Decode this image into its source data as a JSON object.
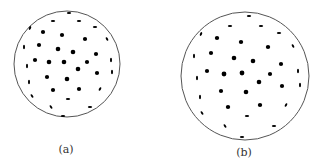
{
  "figure": {
    "colors": {
      "outline": "#555555",
      "dot": "#000000",
      "background": "#ffffff"
    },
    "panels": [
      {
        "id": "a",
        "label": "(a)",
        "label_pos": [
          66,
          150
        ],
        "circle": {
          "cx": 67,
          "cy": 64,
          "r": 53
        },
        "dots": [
          [
            69,
            13,
            2.2,
            1.0,
            0
          ],
          [
            53,
            21,
            2.2,
            1.0,
            0
          ],
          [
            79,
            21,
            2.2,
            1.0,
            0
          ],
          [
            30,
            28,
            1.0,
            2.0,
            25
          ],
          [
            95,
            27,
            2.2,
            1.0,
            0
          ],
          [
            43,
            32,
            2.1,
            2.1,
            0
          ],
          [
            62,
            35,
            2.1,
            2.1,
            0
          ],
          [
            85,
            39,
            2.1,
            2.0,
            0
          ],
          [
            107,
            39,
            1.0,
            2.0,
            -30
          ],
          [
            24,
            47,
            1.0,
            2.2,
            0
          ],
          [
            39,
            45,
            2.1,
            2.1,
            0
          ],
          [
            58,
            49,
            2.3,
            2.3,
            0
          ],
          [
            73,
            52,
            2.3,
            2.3,
            0
          ],
          [
            96,
            54,
            2.1,
            2.1,
            0
          ],
          [
            35,
            60,
            2.1,
            2.1,
            0
          ],
          [
            49,
            62,
            2.3,
            2.3,
            0
          ],
          [
            64,
            62,
            2.3,
            2.3,
            0
          ],
          [
            87,
            62,
            2.1,
            2.1,
            0
          ],
          [
            111,
            60,
            1.0,
            2.2,
            0
          ],
          [
            27,
            66,
            1.0,
            2.2,
            0
          ],
          [
            78,
            69,
            2.3,
            2.3,
            0
          ],
          [
            97,
            73,
            2.1,
            2.1,
            0
          ],
          [
            112,
            72,
            1.0,
            2.2,
            0
          ],
          [
            47,
            77,
            2.1,
            2.1,
            0
          ],
          [
            67,
            79,
            2.3,
            2.3,
            0
          ],
          [
            29,
            82,
            1.0,
            2.2,
            0
          ],
          [
            53,
            90,
            2.1,
            2.0,
            0
          ],
          [
            79,
            89,
            2.1,
            2.0,
            0
          ],
          [
            100,
            89,
            1.0,
            2.0,
            30
          ],
          [
            32,
            96,
            1.0,
            2.0,
            -35
          ],
          [
            68,
            99,
            2.2,
            1.0,
            0
          ],
          [
            51,
            107,
            1.0,
            2.0,
            -35
          ],
          [
            90,
            107,
            2.2,
            1.0,
            0
          ],
          [
            63,
            116,
            2.2,
            1.0,
            0
          ]
        ]
      },
      {
        "id": "b",
        "label": "(b)",
        "label_pos": [
          244,
          153
        ],
        "circle": {
          "cx": 245,
          "cy": 76,
          "r": 64
        },
        "dots": [
          [
            249,
            16,
            2.2,
            1.0,
            0
          ],
          [
            230,
            26,
            2.2,
            1.0,
            0
          ],
          [
            261,
            26,
            2.2,
            1.0,
            0
          ],
          [
            279,
            33,
            2.2,
            1.0,
            0
          ],
          [
            201,
            34,
            1.0,
            2.0,
            25
          ],
          [
            217,
            38,
            2.2,
            2.0,
            0
          ],
          [
            241,
            42,
            2.2,
            2.0,
            0
          ],
          [
            268,
            47,
            2.2,
            2.0,
            0
          ],
          [
            293,
            46,
            1.0,
            2.0,
            -30
          ],
          [
            194,
            56,
            1.0,
            2.2,
            0
          ],
          [
            211,
            53,
            2.1,
            2.1,
            0
          ],
          [
            234,
            58,
            2.3,
            2.3,
            0
          ],
          [
            253,
            61,
            2.3,
            2.3,
            0
          ],
          [
            281,
            64,
            2.1,
            2.1,
            0
          ],
          [
            207,
            71,
            2.1,
            2.1,
            0
          ],
          [
            224,
            74,
            2.4,
            2.4,
            0
          ],
          [
            242,
            73,
            2.4,
            2.4,
            0
          ],
          [
            270,
            74,
            2.1,
            2.1,
            0
          ],
          [
            298,
            71,
            1.0,
            2.2,
            0
          ],
          [
            197,
            78,
            1.0,
            2.2,
            0
          ],
          [
            259,
            82,
            2.3,
            2.3,
            0
          ],
          [
            282,
            86,
            2.1,
            2.1,
            0
          ],
          [
            300,
            85,
            1.0,
            2.2,
            0
          ],
          [
            221,
            91,
            2.1,
            2.1,
            0
          ],
          [
            246,
            92,
            2.3,
            2.3,
            0
          ],
          [
            200,
            97,
            1.0,
            2.2,
            0
          ],
          [
            228,
            107,
            2.2,
            2.0,
            0
          ],
          [
            260,
            105,
            2.2,
            2.0,
            0
          ],
          [
            286,
            105,
            1.0,
            2.0,
            30
          ],
          [
            202,
            113,
            1.0,
            2.0,
            -35
          ],
          [
            247,
            116,
            2.2,
            1.0,
            0
          ],
          [
            225,
            126,
            1.0,
            2.0,
            -35
          ],
          [
            274,
            126,
            2.2,
            1.0,
            0
          ],
          [
            242,
            137,
            2.2,
            1.0,
            0
          ]
        ]
      }
    ]
  }
}
